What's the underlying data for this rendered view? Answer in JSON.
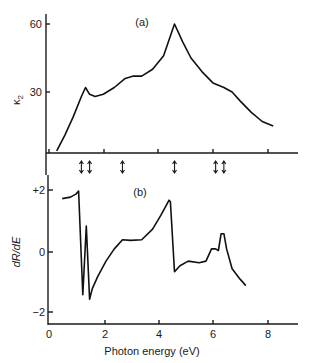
{
  "chart_data": [
    {
      "panel": "(a)",
      "type": "line",
      "title": "",
      "xlabel": "",
      "ylabel": "κ₂",
      "xlim": [
        0,
        9
      ],
      "ylim": [
        0,
        65
      ],
      "yticks": [
        30,
        60
      ],
      "xticks": [
        0,
        2,
        4,
        6,
        8
      ],
      "grid": false,
      "x": [
        0.3,
        0.6,
        0.9,
        1.2,
        1.35,
        1.5,
        1.7,
        2.0,
        2.4,
        2.8,
        3.1,
        3.4,
        3.8,
        4.2,
        4.6,
        4.9,
        5.2,
        5.6,
        6.0,
        6.4,
        6.7,
        7.0,
        7.4,
        7.8,
        8.2
      ],
      "values": [
        4,
        11,
        19,
        28,
        32,
        29,
        28,
        29,
        32,
        36,
        37,
        37,
        40,
        46,
        60,
        52,
        45,
        39,
        34,
        32,
        30,
        26,
        21,
        17,
        15
      ],
      "series_name": "κ₂"
    },
    {
      "panel": "(b)",
      "type": "line",
      "title": "",
      "xlabel": "Photon energy (eV)",
      "ylabel": "dR/dE",
      "xlim": [
        0,
        9
      ],
      "ylim": [
        -2.4,
        2.4
      ],
      "yticks": [
        -2,
        0,
        2
      ],
      "ytick_labels": [
        "−2",
        "0",
        "+2"
      ],
      "xticks": [
        0,
        2,
        4,
        6,
        8
      ],
      "grid": false,
      "x": [
        0.5,
        0.8,
        1.0,
        1.1,
        1.25,
        1.38,
        1.5,
        1.6,
        1.8,
        2.1,
        2.4,
        2.7,
        3.0,
        3.4,
        3.8,
        4.1,
        4.4,
        4.45,
        4.6,
        4.8,
        5.1,
        5.5,
        5.75,
        5.95,
        6.1,
        6.2,
        6.3,
        6.4,
        6.5,
        6.7,
        7.0,
        7.2
      ],
      "values": [
        1.75,
        1.8,
        1.9,
        2.0,
        -1.4,
        0.85,
        -1.55,
        -1.2,
        -0.8,
        -0.3,
        0.1,
        0.4,
        0.38,
        0.4,
        0.75,
        1.2,
        1.7,
        1.65,
        -0.65,
        -0.45,
        -0.3,
        -0.35,
        -0.3,
        0.1,
        0.1,
        0.05,
        0.6,
        0.6,
        0.1,
        -0.55,
        -0.9,
        -1.1
      ],
      "series_name": "dR/dE"
    }
  ],
  "labels": {
    "panel_a": "(a)",
    "panel_b": "(b)",
    "ylabel_a": "κ",
    "ylabel_a_sub": "2",
    "ylabel_b": "dR/dE",
    "xlabel": "Photon energy (eV)",
    "ytick_a_60": "60",
    "ytick_a_30": "30",
    "ytick_b_p2": "+2",
    "ytick_b_0": "0",
    "ytick_b_m2": "−2",
    "xtick_0": "0",
    "xtick_2": "2",
    "xtick_4": "4",
    "xtick_6": "6",
    "xtick_8": "8"
  },
  "transition_arrows_eV": [
    1.2,
    1.5,
    2.7,
    4.6,
    6.1,
    6.4
  ]
}
